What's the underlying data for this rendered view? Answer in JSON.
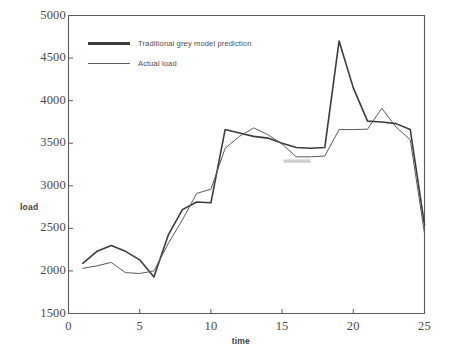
{
  "chart_data": {
    "type": "line",
    "title": "",
    "xlabel": "time",
    "ylabel": "load",
    "xlim": [
      0,
      25
    ],
    "ylim": [
      1500,
      5000
    ],
    "xticks": [
      "0",
      "5",
      "10",
      "15",
      "20",
      "25"
    ],
    "yticks": [
      "1500",
      "2000",
      "2500",
      "3000",
      "3500",
      "4000",
      "4500",
      "5000"
    ],
    "grid": false,
    "legend_position": "upper-left-inside",
    "x": [
      1,
      2,
      3,
      4,
      5,
      6,
      7,
      8,
      9,
      10,
      11,
      12,
      13,
      14,
      15,
      16,
      17,
      18,
      19,
      20,
      21,
      22,
      23,
      24,
      25
    ],
    "series": [
      {
        "name": "Traditional grey model prediction",
        "color": "#3c3c3c",
        "width": 1.6,
        "values": [
          2090,
          2230,
          2300,
          2230,
          2130,
          1930,
          2420,
          2720,
          2810,
          2800,
          3660,
          3620,
          3580,
          3560,
          3500,
          3450,
          3440,
          3450,
          4700,
          4150,
          3760,
          3750,
          3730,
          3660,
          2540
        ]
      },
      {
        "name": "Actual load",
        "color": "#5a5a5a",
        "width": 1.0,
        "values": [
          2030,
          2060,
          2100,
          1980,
          1970,
          2000,
          2320,
          2600,
          2910,
          2960,
          3440,
          3580,
          3680,
          3600,
          3490,
          3340,
          3340,
          3350,
          3660,
          3660,
          3665,
          3910,
          3690,
          3540,
          2440
        ]
      }
    ],
    "legend": [
      {
        "label": "Traditional grey model prediction",
        "color": "#3c3c3c",
        "width": 3.0
      },
      {
        "label": "Actual load",
        "color": "#5a5a5a",
        "width": 1.2
      }
    ],
    "annotations": [
      {
        "type": "smudge",
        "x_range": [
          15.1,
          17.0
        ],
        "y": 3290,
        "color": "#a9a9a9"
      }
    ]
  },
  "axes": {
    "frame_color": "#5a5a5a"
  }
}
